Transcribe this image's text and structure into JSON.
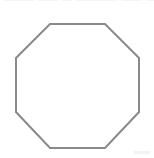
{
  "page": {
    "background_color": "#ffffff",
    "width": 154,
    "height": 158
  },
  "header": {
    "clipped_text": "——— —— — ————  ——  — ———— ——",
    "note": "clipped-illegible-text-row"
  },
  "figure": {
    "name": "octagon",
    "shape_type": "regular-octagon",
    "sides": 8,
    "stroke_color": "#8a8a8a",
    "stroke_width": 2,
    "fill_color": "none",
    "label": "",
    "points": "50,24 105,24 139,58 139,112 105,148 50,148 16,112 16,58",
    "bounds": {
      "left": 16,
      "top": 24,
      "right": 139,
      "bottom": 148,
      "width": 123,
      "height": 124
    }
  },
  "artifacts": {
    "corner_smudge_color": "#f2f2f4"
  }
}
